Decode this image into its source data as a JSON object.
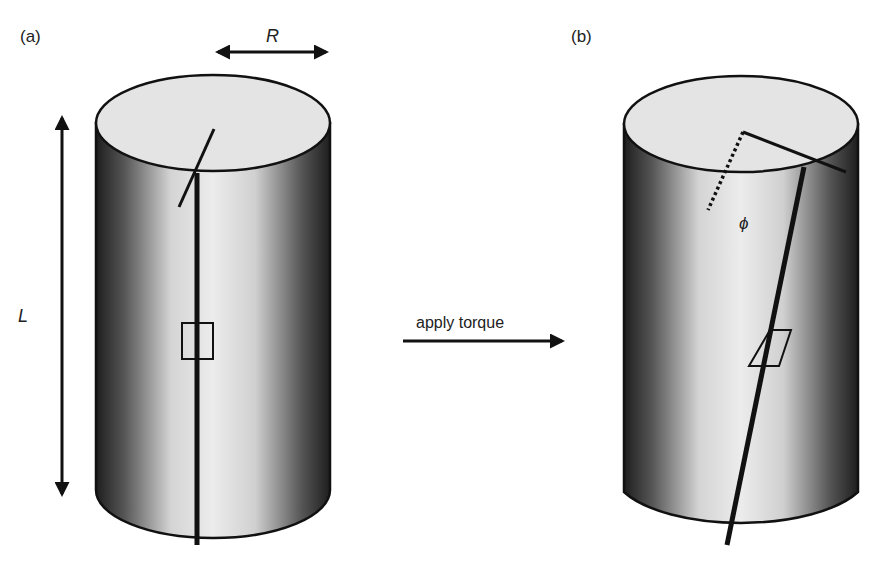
{
  "panels": {
    "a": {
      "label": "(a)"
    },
    "b": {
      "label": "(b)"
    }
  },
  "dimensions": {
    "radius_label": "R",
    "length_label": "L",
    "angle_label": "ϕ"
  },
  "arrow": {
    "label": "apply torque"
  },
  "colors": {
    "line": "#111111",
    "top_face": "#e4e4e4",
    "side_dark": "#2a2a2a",
    "side_light": "#e8e8e8"
  }
}
